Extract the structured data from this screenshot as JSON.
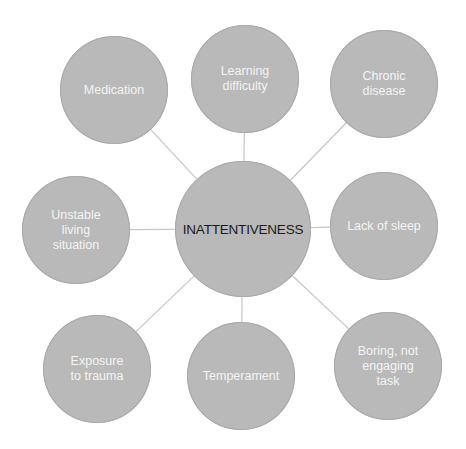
{
  "diagram": {
    "type": "hub-and-spoke",
    "colors": {
      "node_fill": "#b9b9b9",
      "connector": "#c6c6c6",
      "center_text": "#1a1a1a",
      "satellite_text": "#f4f4f4",
      "background": "#ffffff"
    },
    "center": {
      "label": "INATTENTIVENESS",
      "cx": 243,
      "cy": 229,
      "r": 68
    },
    "satellites": [
      {
        "id": "medication",
        "label": "Medication",
        "cx": 114,
        "cy": 90,
        "r": 54
      },
      {
        "id": "learning-difficulty",
        "label": "Learning\ndifficulty",
        "cx": 245,
        "cy": 79,
        "r": 54
      },
      {
        "id": "chronic-disease",
        "label": "Chronic\ndisease",
        "cx": 384,
        "cy": 84,
        "r": 54
      },
      {
        "id": "lack-of-sleep",
        "label": "Lack of sleep",
        "cx": 384,
        "cy": 226,
        "r": 54
      },
      {
        "id": "boring-task",
        "label": "Boring, not\nengaging\ntask",
        "cx": 388,
        "cy": 366,
        "r": 54
      },
      {
        "id": "temperament",
        "label": "Temperament",
        "cx": 241,
        "cy": 376,
        "r": 54
      },
      {
        "id": "exposure-to-trauma",
        "label": "Exposure\nto trauma",
        "cx": 97,
        "cy": 369,
        "r": 54
      },
      {
        "id": "unstable-living",
        "label": "Unstable\nliving\nsituation",
        "cx": 76,
        "cy": 230,
        "r": 54
      }
    ]
  }
}
